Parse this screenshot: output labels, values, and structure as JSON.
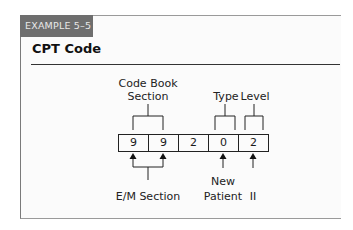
{
  "example_label": "EXAMPLE 5–5",
  "title": "CPT Code",
  "code": {
    "digits": [
      "9",
      "9",
      "2",
      "0",
      "2"
    ]
  },
  "top_labels": {
    "section_line1": "Code Book",
    "section_line2": "Section",
    "type": "Type",
    "level": "Level"
  },
  "bottom_labels": {
    "em_section": "E/M Section",
    "new_line1": "New",
    "new_line2": "Patient",
    "level_value": "II"
  },
  "colors": {
    "tag_bg": "#6e6e6e",
    "border": "#9a9a9a"
  }
}
